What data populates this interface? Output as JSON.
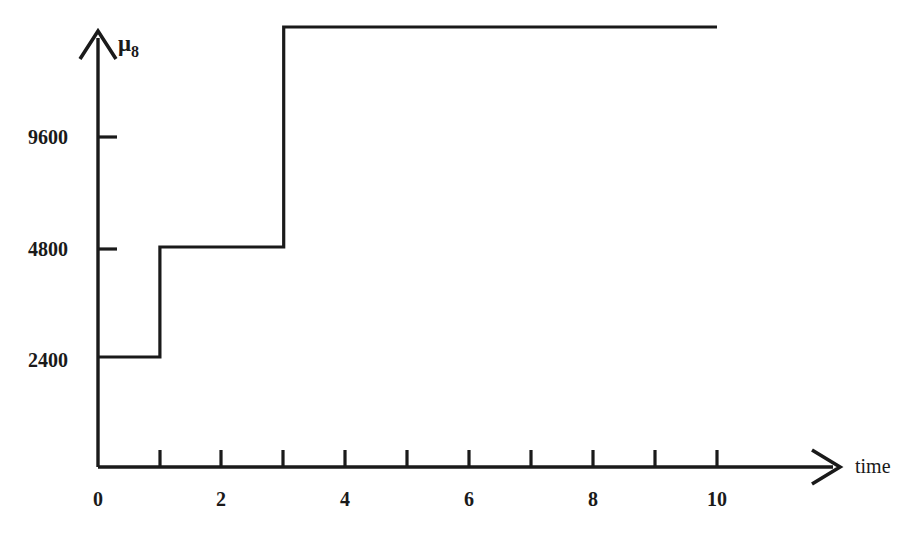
{
  "chart_data": {
    "type": "line",
    "title": "",
    "xlabel": "time",
    "ylabel": "mu_8",
    "ylabel_base": "μ",
    "ylabel_sub": "8",
    "step_style": "post",
    "x": [
      0,
      1,
      1,
      3,
      3,
      10
    ],
    "values": [
      2400,
      2400,
      4800,
      4800,
      9600,
      9600
    ],
    "steps": [
      {
        "from": 0,
        "to": 1,
        "value": 2400
      },
      {
        "from": 1,
        "to": 3,
        "value": 4800
      },
      {
        "from": 3,
        "to": 10,
        "value": 9600
      }
    ],
    "xlim": [
      0,
      10
    ],
    "ylim": [
      0,
      11200
    ],
    "xticks": [
      0,
      1,
      2,
      3,
      4,
      5,
      6,
      7,
      8,
      9,
      10
    ],
    "xtick_labels": [
      "0",
      "",
      "2",
      "",
      "4",
      "",
      "6",
      "",
      "8",
      "",
      "10"
    ],
    "yticks": [
      2400,
      4800,
      9600
    ],
    "ytick_labels": [
      "2400",
      "4800",
      "9600"
    ],
    "grid": false,
    "legend": null,
    "line_color": "#1a1a1a",
    "background_color": "#ffffff"
  },
  "axes": {
    "x_axis_label": "time",
    "y_axis_label_base": "μ",
    "y_axis_label_sub": "8"
  },
  "y_tick_labels": {
    "t0": "9600",
    "t1": "4800",
    "t2": "2400"
  },
  "x_tick_labels": {
    "t0": "0",
    "t2": "2",
    "t4": "4",
    "t6": "6",
    "t8": "8",
    "t10": "10"
  }
}
